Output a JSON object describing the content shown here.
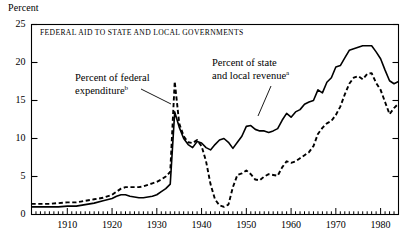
{
  "axis_label_top": "Percent",
  "chart_title": "FEDERAL AID TO STATE AND LOCAL GOVERNMENTS",
  "annotations": {
    "federal_expenditure": {
      "line1": "Percent of federal",
      "line2": "expenditure",
      "marker": "b"
    },
    "state_local_revenue": {
      "line1": "Percent of state",
      "line2": "and local revenue",
      "marker": "a"
    }
  },
  "chart_data": {
    "type": "line",
    "title": "FEDERAL AID TO STATE AND LOCAL GOVERNMENTS",
    "xlabel": "",
    "ylabel": "Percent",
    "xlim": [
      1902,
      1984
    ],
    "ylim": [
      0,
      25
    ],
    "yticks": [
      0,
      5,
      10,
      15,
      20,
      25
    ],
    "xticks": [
      1910,
      1920,
      1930,
      1940,
      1950,
      1960,
      1970,
      1980
    ],
    "xminor_step": 1,
    "grid": false,
    "legend": "inline-annotations",
    "series": [
      {
        "name": "Percent of state and local revenue",
        "style": "solid",
        "footnote": "a",
        "x": [
          1902,
          1904,
          1906,
          1908,
          1910,
          1912,
          1913,
          1914,
          1916,
          1918,
          1920,
          1921,
          1922,
          1923,
          1924,
          1925,
          1926,
          1927,
          1928,
          1929,
          1930,
          1931,
          1932,
          1933,
          1934,
          1935,
          1936,
          1937,
          1938,
          1939,
          1940,
          1941,
          1942,
          1943,
          1944,
          1945,
          1946,
          1947,
          1948,
          1949,
          1950,
          1951,
          1952,
          1953,
          1954,
          1955,
          1956,
          1957,
          1958,
          1959,
          1960,
          1961,
          1962,
          1963,
          1964,
          1965,
          1966,
          1967,
          1968,
          1969,
          1970,
          1971,
          1972,
          1973,
          1974,
          1975,
          1976,
          1977,
          1978,
          1979,
          1980,
          1981,
          1982,
          1983,
          1984
        ],
        "y": [
          1.0,
          1.0,
          1.0,
          1.0,
          1.1,
          1.1,
          1.2,
          1.3,
          1.5,
          1.8,
          2.1,
          2.4,
          2.6,
          2.6,
          2.4,
          2.3,
          2.2,
          2.2,
          2.3,
          2.4,
          2.6,
          3.0,
          3.4,
          4.0,
          13.5,
          11.5,
          10.0,
          9.2,
          8.8,
          9.6,
          9.4,
          8.8,
          8.5,
          9.2,
          9.8,
          10.0,
          9.5,
          8.7,
          9.5,
          10.3,
          11.6,
          11.7,
          11.2,
          11.0,
          11.0,
          10.8,
          11.0,
          11.3,
          12.4,
          13.3,
          12.8,
          13.5,
          13.8,
          14.5,
          14.8,
          15.0,
          16.4,
          16.0,
          17.4,
          18.0,
          19.4,
          19.6,
          20.6,
          21.6,
          21.8,
          22.0,
          22.2,
          22.2,
          22.2,
          21.4,
          20.5,
          19.0,
          17.6,
          17.2,
          17.5
        ]
      },
      {
        "name": "Percent of federal expenditure",
        "style": "dashed",
        "footnote": "b",
        "x": [
          1902,
          1904,
          1906,
          1908,
          1910,
          1912,
          1913,
          1914,
          1916,
          1918,
          1920,
          1921,
          1922,
          1923,
          1924,
          1925,
          1926,
          1927,
          1928,
          1929,
          1930,
          1931,
          1932,
          1933,
          1934,
          1935,
          1936,
          1937,
          1938,
          1939,
          1940,
          1941,
          1942,
          1943,
          1944,
          1945,
          1946,
          1947,
          1948,
          1949,
          1950,
          1951,
          1952,
          1953,
          1954,
          1955,
          1956,
          1957,
          1958,
          1959,
          1960,
          1961,
          1962,
          1963,
          1964,
          1965,
          1966,
          1967,
          1968,
          1969,
          1970,
          1971,
          1972,
          1973,
          1974,
          1975,
          1976,
          1977,
          1978,
          1979,
          1980,
          1981,
          1982,
          1983,
          1984
        ],
        "y": [
          1.4,
          1.4,
          1.4,
          1.5,
          1.6,
          1.6,
          1.7,
          1.8,
          2.0,
          2.2,
          2.6,
          3.0,
          3.4,
          3.6,
          3.6,
          3.6,
          3.6,
          3.7,
          3.9,
          4.1,
          4.3,
          4.6,
          5.0,
          5.6,
          17.5,
          12.0,
          10.3,
          9.5,
          9.4,
          9.8,
          9.0,
          7.0,
          4.0,
          2.0,
          1.2,
          1.0,
          1.3,
          3.6,
          5.2,
          5.4,
          5.8,
          5.3,
          4.6,
          4.5,
          5.0,
          5.3,
          5.2,
          5.1,
          6.2,
          7.0,
          6.8,
          7.0,
          7.4,
          7.8,
          8.2,
          9.0,
          10.6,
          11.4,
          12.0,
          12.3,
          13.1,
          14.2,
          15.8,
          17.2,
          18.0,
          18.2,
          17.8,
          18.5,
          18.6,
          17.3,
          16.4,
          14.8,
          13.2,
          14.0,
          14.6
        ]
      }
    ]
  }
}
